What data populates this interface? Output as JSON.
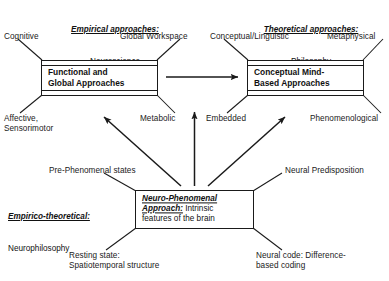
{
  "headings": {
    "empirical": {
      "title": "Empirical approaches:",
      "subtitle": "Neuroscience"
    },
    "theoretical": {
      "title": "Theoretical approaches:",
      "subtitle": "Philosophy"
    },
    "empirico_theoretical": {
      "title": "Empirico-theoretical:",
      "subtitle": "Neurophilosophy"
    }
  },
  "boxes": {
    "functional_global": {
      "label": "Functional and\nGlobal Approaches"
    },
    "conceptual_mind": {
      "label": "Conceptual Mind-\nBased Approaches"
    },
    "neuro_phenomenal": {
      "emphasis": "Neuro-Phenomenal\nApproach:",
      "rest": " Intrinsic\nfeatures of the brain"
    }
  },
  "labels": {
    "cognitive": "Cognitive",
    "global_workspace": "Global Workspace",
    "conceptual_linguistic": "Conceptual/Linguistic",
    "metaphysical": "Metaphysical",
    "affective_sensorimotor": "Affective,\nSensorimotor",
    "metabolic": "Metabolic",
    "embedded": "Embedded",
    "phenomenological": "Phenomenological",
    "pre_phenomenal": "Pre-Phenomenal states",
    "neural_predisposition": "Neural Predisposition",
    "resting_state": "Resting state:\nSpatiotemporal structure",
    "neural_code": "Neural code: Difference-\nbased coding"
  },
  "colors": {
    "stroke": "#1a1a1a",
    "text": "#111111",
    "background": "#ffffff"
  }
}
